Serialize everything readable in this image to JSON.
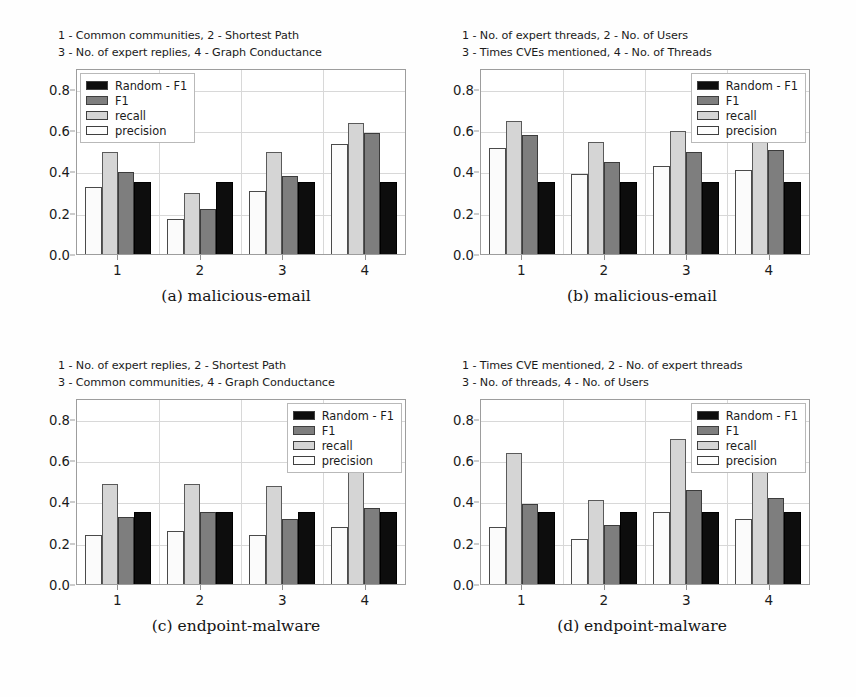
{
  "figure": {
    "series_order": [
      "precision",
      "recall",
      "f1",
      "random_f1"
    ],
    "legend_order": [
      "Random - F1",
      "F1",
      "recall",
      "precision"
    ],
    "colors": {
      "random_f1": "#0d0d0d",
      "f1": "#7e7e7e",
      "recall": "#d5d5d5",
      "precision": "#fbfbfb",
      "grid": "#d8d8d8",
      "frame": "#9d9d9d"
    },
    "legend": {
      "random_label": "Random - F1",
      "f1_label": "F1",
      "recall_label": "recall",
      "precision_label": "precision"
    },
    "yticks": [
      "0.0",
      "0.2",
      "0.4",
      "0.6",
      "0.8"
    ],
    "xticks": [
      "1",
      "2",
      "3",
      "4"
    ]
  },
  "panels": [
    {
      "id": "a",
      "key_line_1": "1 - Common communities, 2 - Shortest Path",
      "key_line_2": "3 - No. of expert replies, 4 - Graph Conductance",
      "caption": "(a)  malicious-email",
      "legend_position": "left",
      "chart_data": {
        "type": "bar",
        "title": "(a)  malicious-email",
        "xlabel": "",
        "ylabel": "",
        "ylim": [
          0.0,
          0.9
        ],
        "yticks": [
          0.0,
          0.2,
          0.4,
          0.6,
          0.8
        ],
        "grid": true,
        "legend_position": "upper left",
        "categories": [
          "1",
          "2",
          "3",
          "4"
        ],
        "category_meanings": [
          "Common communities",
          "Shortest Path",
          "No. of expert replies",
          "Graph Conductance"
        ],
        "series": [
          {
            "name": "precision",
            "values": [
              0.33,
              0.17,
              0.31,
              0.54
            ]
          },
          {
            "name": "recall",
            "values": [
              0.5,
              0.3,
              0.5,
              0.64
            ]
          },
          {
            "name": "F1",
            "values": [
              0.4,
              0.22,
              0.38,
              0.59
            ]
          },
          {
            "name": "Random - F1",
            "values": [
              0.35,
              0.35,
              0.35,
              0.35
            ]
          }
        ]
      }
    },
    {
      "id": "b",
      "key_line_1": "1 - No. of expert threads, 2 - No. of Users",
      "key_line_2": "3 - Times CVEs mentioned, 4 - No. of Threads",
      "caption": "(b)  malicious-email",
      "legend_position": "right",
      "chart_data": {
        "type": "bar",
        "title": "(b)  malicious-email",
        "xlabel": "",
        "ylabel": "",
        "ylim": [
          0.0,
          0.9
        ],
        "yticks": [
          0.0,
          0.2,
          0.4,
          0.6,
          0.8
        ],
        "grid": true,
        "legend_position": "upper right",
        "categories": [
          "1",
          "2",
          "3",
          "4"
        ],
        "category_meanings": [
          "No. of expert threads",
          "No. of Users",
          "Times CVEs mentioned",
          "No. of Threads"
        ],
        "series": [
          {
            "name": "precision",
            "values": [
              0.52,
              0.39,
              0.43,
              0.41
            ]
          },
          {
            "name": "recall",
            "values": [
              0.65,
              0.55,
              0.6,
              0.6
            ]
          },
          {
            "name": "F1",
            "values": [
              0.58,
              0.45,
              0.5,
              0.51
            ]
          },
          {
            "name": "Random - F1",
            "values": [
              0.35,
              0.35,
              0.35,
              0.35
            ]
          }
        ]
      }
    },
    {
      "id": "c",
      "key_line_1": "1 - No. of expert replies, 2 - Shortest Path",
      "key_line_2": "3 - Common communities, 4 - Graph Conductance",
      "caption": "(c)  endpoint-malware",
      "legend_position": "right",
      "chart_data": {
        "type": "bar",
        "title": "(c)  endpoint-malware",
        "xlabel": "",
        "ylabel": "",
        "ylim": [
          0.0,
          0.9
        ],
        "yticks": [
          0.0,
          0.2,
          0.4,
          0.6,
          0.8
        ],
        "grid": true,
        "legend_position": "upper right",
        "categories": [
          "1",
          "2",
          "3",
          "4"
        ],
        "category_meanings": [
          "No. of expert replies",
          "Shortest Path",
          "Common communities",
          "Graph Conductance"
        ],
        "series": [
          {
            "name": "precision",
            "values": [
              0.24,
              0.26,
              0.24,
              0.28
            ]
          },
          {
            "name": "recall",
            "values": [
              0.49,
              0.49,
              0.48,
              0.56
            ]
          },
          {
            "name": "F1",
            "values": [
              0.33,
              0.35,
              0.32,
              0.37
            ]
          },
          {
            "name": "Random - F1",
            "values": [
              0.35,
              0.35,
              0.35,
              0.35
            ]
          }
        ]
      }
    },
    {
      "id": "d",
      "key_line_1": "1 - Times CVE mentioned, 2 - No. of expert threads",
      "key_line_2": "3 - No. of threads, 4 - No. of Users",
      "caption": "(d)  endpoint-malware",
      "legend_position": "right",
      "chart_data": {
        "type": "bar",
        "title": "(d)  endpoint-malware",
        "xlabel": "",
        "ylabel": "",
        "ylim": [
          0.0,
          0.9
        ],
        "yticks": [
          0.0,
          0.2,
          0.4,
          0.6,
          0.8
        ],
        "grid": true,
        "legend_position": "upper right",
        "categories": [
          "1",
          "2",
          "3",
          "4"
        ],
        "category_meanings": [
          "Times CVE mentioned",
          "No. of expert threads",
          "No. of threads",
          "No. of Users"
        ],
        "series": [
          {
            "name": "precision",
            "values": [
              0.28,
              0.22,
              0.35,
              0.32
            ]
          },
          {
            "name": "recall",
            "values": [
              0.64,
              0.41,
              0.71,
              0.6
            ]
          },
          {
            "name": "F1",
            "values": [
              0.39,
              0.29,
              0.46,
              0.42
            ]
          },
          {
            "name": "Random - F1",
            "values": [
              0.35,
              0.35,
              0.35,
              0.35
            ]
          }
        ]
      }
    }
  ]
}
